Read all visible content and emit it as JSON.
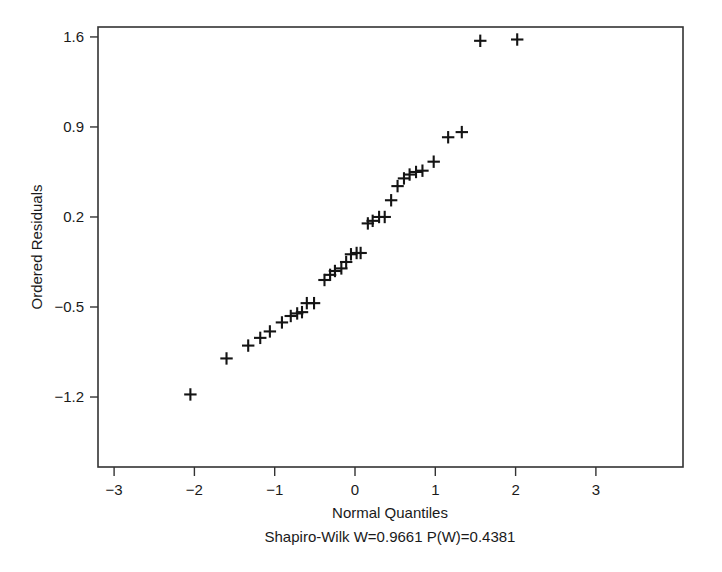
{
  "figure": {
    "title": "",
    "background_color": "#ffffff",
    "frame_color": "#333333",
    "marker_color": "#141414"
  },
  "labels": {
    "y_axis_title": "Ordered Residuals",
    "x_axis_title": "Normal Quantiles",
    "caption": "Shapiro-Wilk W=0.9661 P(W)=0.4381"
  },
  "statistics": {
    "test_name": "Shapiro-Wilk",
    "W_label": "W=0.9661",
    "W_value": 0.9661,
    "P_label": "P(W)=0.4381",
    "P_value": 0.4381
  },
  "chart_data": {
    "type": "scatter",
    "title": "",
    "subtitle": "Shapiro-Wilk W=0.9661 P(W)=0.4381",
    "xlabel": "Normal Quantiles",
    "ylabel": "Ordered Residuals",
    "xlim": [
      -3.3,
      3.3
    ],
    "ylim": [
      -1.52,
      1.93
    ],
    "xticks": [
      -3,
      -2,
      -1,
      0,
      1,
      2,
      3
    ],
    "xticklabels": [
      "-3",
      "-2",
      "-1",
      "0",
      "1",
      "2",
      "3"
    ],
    "yticks": [
      1.6,
      0.9,
      0.2,
      -0.5,
      -1.2
    ],
    "yticklabels": [
      "1.6",
      "0.9",
      "0.2",
      "-0.5",
      "-1.2"
    ],
    "grid": false,
    "legend": false,
    "marker": "plus",
    "n_points": 33,
    "series": [
      {
        "name": "Ordered Residuals",
        "x": [
          -2.05,
          -1.6,
          -1.33,
          -1.18,
          -1.06,
          -0.91,
          -0.8,
          -0.72,
          -0.66,
          -0.6,
          -0.51,
          -0.38,
          -0.31,
          -0.25,
          -0.17,
          -0.11,
          -0.05,
          0.02,
          0.07,
          0.16,
          0.22,
          0.3,
          0.37,
          0.45,
          0.53,
          0.61,
          0.68,
          0.76,
          0.84,
          0.98,
          1.16,
          1.33,
          1.56,
          2.02
        ],
        "y": [
          -1.18,
          -0.9,
          -0.8,
          -0.74,
          -0.69,
          -0.62,
          -0.57,
          -0.55,
          -0.54,
          -0.47,
          -0.47,
          -0.29,
          -0.25,
          -0.22,
          -0.2,
          -0.15,
          -0.09,
          -0.08,
          -0.08,
          0.15,
          0.17,
          0.2,
          0.2,
          0.33,
          0.44,
          0.5,
          0.53,
          0.55,
          0.56,
          0.63,
          0.82,
          0.86,
          1.57,
          1.58
        ]
      }
    ]
  },
  "plot_geometry": {
    "frame_left": 98,
    "frame_top": 27,
    "frame_right": 683,
    "frame_bottom": 467,
    "x_pixels_per_unit": 80.3,
    "y_pixels_per_unit": 128.6,
    "x_origin_px": 355,
    "y_origin_px": 242.7
  }
}
